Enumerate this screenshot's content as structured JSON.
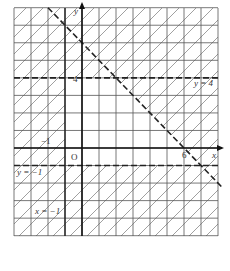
{
  "figure": {
    "type": "coordinate-plane-inequality-region",
    "axes": {
      "x_label": "x",
      "y_label": "y",
      "origin_label": "O"
    },
    "grid": {
      "x_min": -4,
      "x_max": 8,
      "y_min": -5,
      "y_max": 8
    },
    "boundary_lines": [
      {
        "equation": "y = 4",
        "label": "y = 4",
        "style": "dashed"
      },
      {
        "equation": "y = -1",
        "label": "y = −1",
        "style": "dashed"
      },
      {
        "equation": "x = -1",
        "label": "x = −1",
        "style": "solid"
      },
      {
        "equation": "x + y = 6",
        "label": "",
        "style": "dashed"
      }
    ],
    "tick_labels": {
      "y4": "4",
      "yneg1": "−1",
      "x6": "6"
    },
    "unshaded_region": "triangle bounded by x = -1, y = -1, x + y = 6 (and y = 4)",
    "shading": "diagonal hatch outside feasible region"
  },
  "colors": {
    "grid": "#555555",
    "axis": "#111111",
    "hatch": "#777777",
    "background": "#ffffff"
  }
}
